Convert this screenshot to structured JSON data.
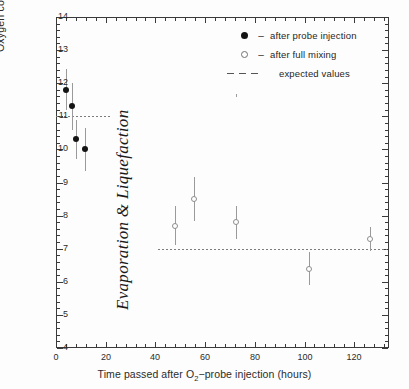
{
  "chart_data": {
    "type": "scatter",
    "title": "",
    "xlabel": "Time passed after O2-probe injection (hours)",
    "xlabel_prefix": "Time passed after O",
    "xlabel_sub": "2",
    "xlabel_suffix": "−probe injection (hours)",
    "ylabel": "Oxygen concentration (ppm)",
    "xlim": [
      0,
      134
    ],
    "ylim": [
      4,
      14
    ],
    "x_major_ticks": [
      0,
      20,
      40,
      60,
      80,
      100,
      120
    ],
    "x_tick_labels": [
      "0",
      "20",
      "40",
      "60",
      "80",
      "100",
      "120"
    ],
    "x_minor_interval": 4,
    "y_major_ticks": [
      4,
      5,
      6,
      7,
      8,
      9,
      10,
      11,
      12,
      13,
      14
    ],
    "y_tick_labels": [
      "4",
      "5",
      "6",
      "7",
      "8",
      "9",
      "10",
      "11",
      "12",
      "13",
      "14"
    ],
    "y_minor_interval": 0.2,
    "grid": false,
    "legend_position": "top-right",
    "annotations": [
      {
        "text": "Evaporation & Liquefaction",
        "rotation": -90,
        "x": 34,
        "y": 8.5
      }
    ],
    "series": [
      {
        "name": "after probe injection",
        "marker": "filled-circle",
        "color": "#141414",
        "points": [
          {
            "x": 4.0,
            "y": 11.8,
            "yerr": 0.62
          },
          {
            "x": 6.5,
            "y": 11.3,
            "yerr": 0.72
          },
          {
            "x": 8.2,
            "y": 10.3,
            "yerr": 0.6
          },
          {
            "x": 11.5,
            "y": 10.0,
            "yerr": 0.65
          }
        ]
      },
      {
        "name": "after full mixing",
        "marker": "open-circle",
        "color": "#8d8d8d",
        "points": [
          {
            "x": 48.0,
            "y": 7.7,
            "yerr": 0.58
          },
          {
            "x": 55.5,
            "y": 8.5,
            "yerr": 0.66
          },
          {
            "x": 72.5,
            "y": 7.8,
            "yerr": 0.5
          },
          {
            "x": 102.0,
            "y": 6.4,
            "yerr": 0.5
          },
          {
            "x": 126.5,
            "y": 7.3,
            "yerr": 0.36
          }
        ]
      }
    ],
    "expected_values": [
      {
        "value": 11.0,
        "x_start": 0,
        "x_end": 22
      },
      {
        "value": 7.0,
        "x_start": 41,
        "x_end": 133
      }
    ]
  },
  "legend": {
    "separator": "–",
    "entries": [
      {
        "marker": "filled-circle",
        "label": "after probe injection"
      },
      {
        "marker": "open-circle",
        "label": "after full mixing"
      },
      {
        "marker": "dashed-line",
        "label": "expected values"
      }
    ]
  },
  "colors": {
    "axis": "#3a3a3a",
    "filled_marker": "#141414",
    "open_marker": "#8d8d8d",
    "error_bar": "#9a9a9a",
    "expected_line": "#7c7c7c",
    "background": "#fdfdfd"
  }
}
